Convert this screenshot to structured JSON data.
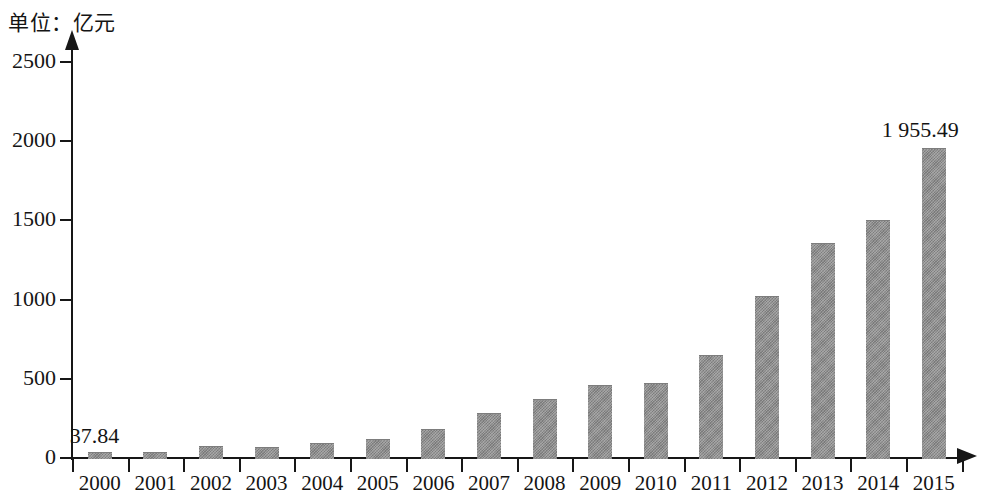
{
  "chart_data": {
    "type": "bar",
    "title": "单位：亿元",
    "subtitle": "",
    "xlabel": "",
    "ylabel": "",
    "unit_caption": "单位：亿元",
    "categories": [
      "2000",
      "2001",
      "2002",
      "2003",
      "2004",
      "2005",
      "2006",
      "2007",
      "2008",
      "2009",
      "2010",
      "2011",
      "2012",
      "2013",
      "2014",
      "2015"
    ],
    "values": [
      37.84,
      40,
      75,
      70,
      95,
      120,
      180,
      285,
      375,
      460,
      475,
      650,
      1025,
      1355,
      1500,
      1955.49
    ],
    "ylim": [
      0,
      2500
    ],
    "ytick_labels": [
      "0",
      "500",
      "1000",
      "1500",
      "2000",
      "2500"
    ],
    "ytick_values": [
      0,
      500,
      1000,
      1500,
      2000,
      2500
    ],
    "grid": false,
    "legend": null,
    "bar_color": "#8b8b8b",
    "axis_color": "#171717",
    "annotations": [
      {
        "text": "37.84",
        "category": "2000",
        "value": 37.84
      },
      {
        "text": "1 955.49",
        "category": "2015",
        "value": 1955.49
      }
    ]
  },
  "axes": {
    "y_ticks": [
      {
        "label": "2500",
        "value": 2500
      },
      {
        "label": "2000",
        "value": 2000
      },
      {
        "label": "1500",
        "value": 1500
      },
      {
        "label": "1000",
        "value": 1000
      },
      {
        "label": "500",
        "value": 500
      },
      {
        "label": "0",
        "value": 0
      }
    ],
    "x_ticks": [
      {
        "label": "2000"
      },
      {
        "label": "2001"
      },
      {
        "label": "2002"
      },
      {
        "label": "2003"
      },
      {
        "label": "2004"
      },
      {
        "label": "2005"
      },
      {
        "label": "2006"
      },
      {
        "label": "2007"
      },
      {
        "label": "2008"
      },
      {
        "label": "2009"
      },
      {
        "label": "2010"
      },
      {
        "label": "2011"
      },
      {
        "label": "2012"
      },
      {
        "label": "2013"
      },
      {
        "label": "2014"
      },
      {
        "label": "2015"
      }
    ]
  }
}
